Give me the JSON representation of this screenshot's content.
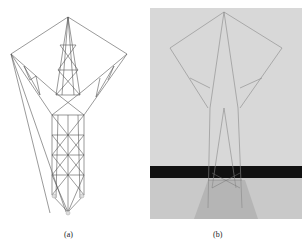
{
  "figure": {
    "panels": [
      {
        "id": "a",
        "caption": "(a)",
        "description": "line drawing of transmission tower truss model"
      },
      {
        "id": "b",
        "caption": "(b)",
        "description": "photograph of physical transmission tower model"
      }
    ]
  }
}
